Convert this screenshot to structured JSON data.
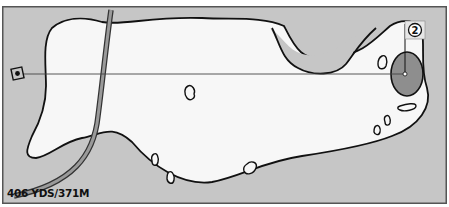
{
  "hole": {
    "number": "2",
    "yardage_label": "406 YDS/371M"
  },
  "colors": {
    "rough": "#c6c6c6",
    "fairway": "#f7f7f7",
    "green": "#8e8e8e",
    "outline": "#111111",
    "path": "#9a9a9a",
    "frame": "#555555"
  },
  "elements": {
    "tee": "tee-marker",
    "flag": "pin-flag",
    "green": "putting-green",
    "fairway": "fairway",
    "cart_path": "cart-path",
    "center_line": "tee-to-pin-line",
    "bunkers": 9
  }
}
